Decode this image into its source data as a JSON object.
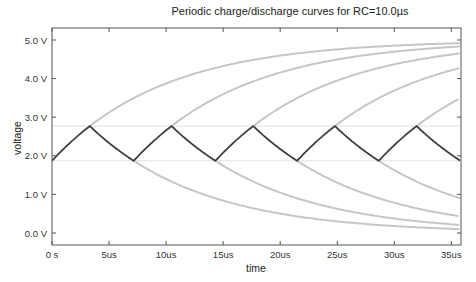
{
  "chart_data": {
    "type": "line",
    "title": "Periodic charge/discharge curves for RC=10.0µs",
    "xlabel": "time",
    "ylabel": "voltage",
    "xlim": [
      0,
      35.8
    ],
    "ylim": [
      -0.3,
      5.3
    ],
    "grid": false,
    "legend": null,
    "x_ticks": [
      0,
      5,
      10,
      15,
      20,
      25,
      30,
      35
    ],
    "x_tick_labels": [
      "0 s",
      "5us",
      "10us",
      "15us",
      "20us",
      "25us",
      "30us",
      "35us"
    ],
    "y_ticks": [
      0,
      1,
      2,
      3,
      4,
      5
    ],
    "y_tick_labels": [
      "0.0 V",
      "1.0 V",
      "2.0 V",
      "3.0 V",
      "4.0 V",
      "5.0 V"
    ],
    "rc_us": 10.0,
    "supply_v": 5.0,
    "threshold_low_v": 1.87,
    "threshold_high_v": 2.77,
    "series": [
      {
        "name": "capacitor voltage (periodic)",
        "color": "#3a3a3a",
        "points": [
          [
            0,
            1.87
          ],
          [
            3.3,
            2.77
          ],
          [
            7.1,
            1.87
          ],
          [
            10.4,
            2.77
          ],
          [
            14.3,
            1.87
          ],
          [
            17.6,
            2.77
          ],
          [
            21.5,
            1.87
          ],
          [
            24.8,
            2.77
          ],
          [
            28.7,
            1.87
          ],
          [
            32.0,
            2.77
          ],
          [
            35.8,
            1.87
          ]
        ]
      },
      {
        "name": "charge curves (extended)",
        "color": "#c8c8c8"
      },
      {
        "name": "discharge curves (extended)",
        "color": "#c8c8c8"
      },
      {
        "name": "threshold lines",
        "color": "#e2e2e2",
        "values": [
          1.87,
          2.77
        ]
      }
    ],
    "colors": {
      "main": "#3a3a3a",
      "envelope": "#c6c6c6",
      "threshold": "#e0e0e0",
      "axis": "#555555"
    }
  }
}
